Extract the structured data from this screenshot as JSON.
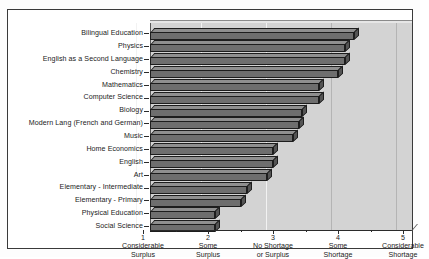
{
  "chart_data": {
    "type": "bar",
    "orientation": "horizontal",
    "title": "",
    "subtitle": "",
    "xlabel": "",
    "ylabel": "",
    "xlim": [
      1,
      5
    ],
    "grid": true,
    "legend": null,
    "categories": [
      "Bilingual Education",
      "Physics",
      "English as a Second Language",
      "Chemistry",
      "Mathematics",
      "Computer Science",
      "Biology",
      "Modern Lang (French and German)",
      "Music",
      "Home Economics",
      "English",
      "Art",
      "Elementary - Intermediate",
      "Elementary - Primary",
      "Physical Education",
      "Social Science"
    ],
    "values": [
      4.05,
      3.9,
      3.9,
      3.8,
      3.5,
      3.5,
      3.25,
      3.2,
      3.1,
      2.8,
      2.8,
      2.7,
      2.4,
      2.3,
      1.9,
      1.9
    ],
    "x_ticks": [
      1,
      2,
      3,
      4,
      5
    ],
    "x_tick_labels": [
      {
        "num": "1",
        "line1": "Considerable",
        "line2": "Surplus"
      },
      {
        "num": "2",
        "line1": "Some",
        "line2": "Surplus"
      },
      {
        "num": "3",
        "line1": "No Shortage",
        "line2": "or Surplus"
      },
      {
        "num": "4",
        "line1": "Some",
        "line2": "Shortage"
      },
      {
        "num": "5",
        "line1": "Considerable",
        "line2": "Shortage"
      }
    ],
    "colors": {
      "bar_face": "#6e6e6e",
      "bar_top": "#8f8f8f",
      "bar_side": "#545454",
      "bar_outline": "#1d1d1d",
      "plot_background": "#d3d3d3",
      "gridline": "#f2f2f2",
      "axis": "#2b2b2b",
      "text": "#1b1b1b",
      "frame": "#3a3a3a",
      "page_background": "#ffffff"
    }
  }
}
